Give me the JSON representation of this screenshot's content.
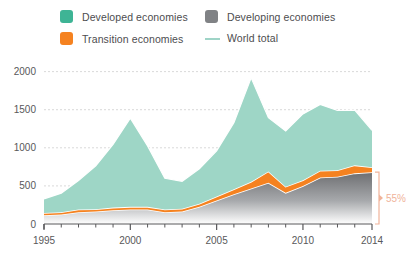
{
  "legend": {
    "items": [
      {
        "label": "Developed economies",
        "icon": "square-swatch-icon",
        "color": "#3eb495",
        "type": "square"
      },
      {
        "label": "Transition economies",
        "icon": "square-swatch-icon",
        "color": "#f58220",
        "type": "square"
      },
      {
        "label": "Developing economies",
        "icon": "square-swatch-icon",
        "color": "#808285",
        "type": "square"
      },
      {
        "label": "World total",
        "icon": "line-swatch-icon",
        "color": "#9fd4c7",
        "type": "line"
      }
    ]
  },
  "annotation": {
    "share_label": "55%",
    "color": "#f0b39a"
  },
  "colors": {
    "developed": "#9ed6c6",
    "transition": "#f58220",
    "developing_top": "#6d6e71",
    "developing_bottom": "#ffffff",
    "world_total_line": "#ffffff",
    "grid": "#d9d9d9",
    "axis": "#58585a",
    "text": "#58585a"
  },
  "chart_data": {
    "type": "area",
    "stacked": true,
    "title": "",
    "subtitle": "",
    "xlabel": "",
    "ylabel": "",
    "xlim": [
      1995,
      2014
    ],
    "ylim": [
      0,
      2100
    ],
    "yticks": [
      0,
      500,
      1000,
      1500,
      2000
    ],
    "ytick_labels": [
      "0",
      "500",
      "1000",
      "1500",
      "2000"
    ],
    "xticks": [
      1995,
      2000,
      2005,
      2010,
      2014
    ],
    "xtick_labels": [
      "1995",
      "2000",
      "2005",
      "2010",
      "2014"
    ],
    "grid": true,
    "legend_position": "top",
    "x": [
      1995,
      1996,
      1997,
      1998,
      1999,
      2000,
      2001,
      2002,
      2003,
      2004,
      2005,
      2006,
      2007,
      2008,
      2009,
      2010,
      2011,
      2012,
      2013,
      2014
    ],
    "series": [
      {
        "name": "Developing economies",
        "color": "#6d6e71",
        "values": [
          115,
          125,
          155,
          165,
          180,
          190,
          190,
          155,
          165,
          225,
          310,
          390,
          465,
          540,
          410,
          500,
          610,
          620,
          665,
          680
        ]
      },
      {
        "name": "Transition economies",
        "color": "#f58220",
        "values": [
          30,
          30,
          35,
          30,
          35,
          35,
          35,
          35,
          35,
          40,
          50,
          65,
          90,
          150,
          80,
          75,
          90,
          85,
          105,
          65
        ]
      },
      {
        "name": "Developed economies",
        "color": "#9ed6c6",
        "values": [
          185,
          250,
          380,
          570,
          830,
          1165,
          800,
          410,
          360,
          460,
          600,
          875,
          1365,
          705,
          730,
          870,
          870,
          785,
          725,
          485
        ]
      }
    ],
    "world_total": {
      "name": "World total",
      "color": "#ffffff",
      "values": [
        330,
        405,
        570,
        765,
        1045,
        1390,
        1025,
        600,
        560,
        725,
        960,
        1330,
        1920,
        1395,
        1220,
        1445,
        1570,
        1490,
        1495,
        1230
      ]
    },
    "annotations": [
      {
        "text": "55%",
        "x": 2014,
        "note": "developing economies share of world total in 2014"
      }
    ]
  }
}
